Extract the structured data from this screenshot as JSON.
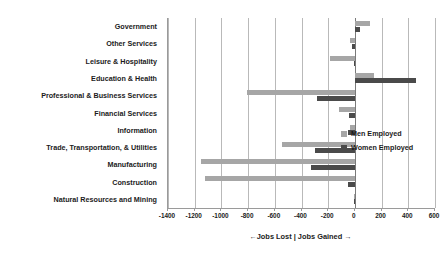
{
  "chart_data": {
    "type": "bar",
    "orientation": "horizontal",
    "title": "",
    "xlabel": "←Jobs Lost | Jobs Gained →",
    "ylabel": "",
    "xlim": [
      -1400,
      600
    ],
    "xticks": [
      -1400,
      -1200,
      -1000,
      -800,
      -600,
      -400,
      -200,
      0,
      200,
      400,
      600
    ],
    "xtick_labels": [
      "-1400",
      "-1200",
      "-1000",
      "-800",
      "-600",
      "-400",
      "-200",
      "0",
      "200",
      "400",
      "600"
    ],
    "grid": true,
    "legend_position": "center-right",
    "categories": [
      "Government",
      "Other Services",
      "Leisure & Hospitality",
      "Education & Health",
      "Professional & Business Services",
      "Financial Services",
      "Information",
      "Trade, Transportation, & Utilities",
      "Manufacturing",
      "Construction",
      "Natural Resources and Mining"
    ],
    "series": [
      {
        "name": "Men Employed",
        "color": "#a6a6a6",
        "values": [
          115,
          -35,
          -185,
          140,
          -805,
          -120,
          -35,
          -545,
          -1155,
          -1125,
          -10
        ]
      },
      {
        "name": "Women Employed",
        "color": "#4a4a4a",
        "values": [
          35,
          -25,
          -5,
          455,
          -285,
          -45,
          -50,
          -300,
          -330,
          -55,
          -5
        ]
      }
    ]
  },
  "legend": {
    "items": [
      {
        "label": "Men Employed",
        "color": "#a6a6a6"
      },
      {
        "label": "Women Employed",
        "color": "#4a4a4a"
      }
    ]
  }
}
